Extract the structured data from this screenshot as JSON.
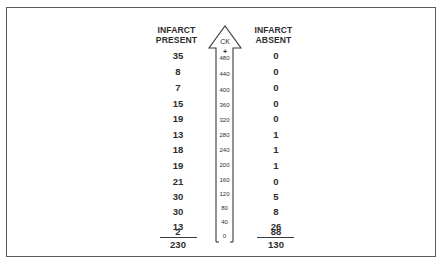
{
  "diagram": {
    "axis_label": "CK",
    "axis_plus": "+",
    "scale_ticks": [
      "480",
      "440",
      "400",
      "360",
      "320",
      "280",
      "240",
      "200",
      "160",
      "120",
      "80",
      "40",
      "0"
    ],
    "left_column": {
      "heading_line1": "INFARCT",
      "heading_line2": "PRESENT",
      "values": [
        "35",
        "8",
        "7",
        "15",
        "19",
        "13",
        "18",
        "19",
        "21",
        "30",
        "30",
        "13",
        "2"
      ],
      "total": "230"
    },
    "right_column": {
      "heading_line1": "INFARCT",
      "heading_line2": "ABSENT",
      "values": [
        "0",
        "0",
        "0",
        "0",
        "0",
        "1",
        "1",
        "1",
        "0",
        "5",
        "8",
        "26",
        "88"
      ],
      "total": "130"
    }
  }
}
